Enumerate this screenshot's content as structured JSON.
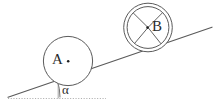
{
  "figure": {
    "type": "physics-diagram",
    "width": 217,
    "height": 105,
    "background_color": "#ffffff",
    "line_color": "#555555",
    "label_color": "#2b2b2b",
    "dotted_color": "#aaaaaa"
  },
  "labels": {
    "body_a": "A",
    "body_b": "B",
    "angle": "α"
  },
  "bodies": [
    {
      "name": "block-a",
      "label": "A",
      "shape": "circle",
      "center": {
        "x": 68,
        "y": 61
      },
      "radius": 24.5,
      "rings": 1,
      "spokes": 0,
      "center_dot": true
    },
    {
      "name": "wheel-b",
      "label": "B",
      "shape": "double-circle",
      "center": {
        "x": 148,
        "y": 27.5
      },
      "radius_outer": 24.5,
      "radius_inner": 21.0,
      "rings": 2,
      "spokes": 4,
      "center_dot": true
    }
  ],
  "incline": {
    "name": "incline-surface",
    "start": {
      "x": 8,
      "y": 97
    },
    "end": {
      "x": 212,
      "y": 27
    },
    "angle_degrees": 19
  },
  "baseline": {
    "name": "horizontal-reference",
    "start": {
      "x": 8,
      "y": 98
    },
    "end": {
      "x": 106,
      "y": 98
    },
    "style": "dotted"
  },
  "angle_marker": {
    "name": "angle-arc",
    "vertex": {
      "x": 8,
      "y": 97
    },
    "arc_radius": 52,
    "label": "α",
    "label_position": {
      "x": 64,
      "y": 93
    }
  },
  "tick": {
    "name": "vertical-tick",
    "x": 58,
    "y_top": 80,
    "y_bottom": 98
  }
}
